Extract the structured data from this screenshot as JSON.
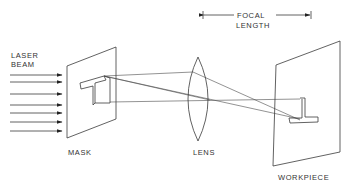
{
  "diagram": {
    "labels": {
      "laser_beam_line1": "LASER",
      "laser_beam_line2": "BEAM",
      "mask": "MASK",
      "lens": "LENS",
      "workpiece": "WORKPIECE",
      "focal_length_line1": "FOCAL",
      "focal_length_line2": "LENGTH"
    },
    "components": [
      {
        "id": "laser-beam",
        "type": "arrows",
        "count": 7
      },
      {
        "id": "mask",
        "type": "plane",
        "pattern": "T"
      },
      {
        "id": "lens",
        "type": "convex-lens"
      },
      {
        "id": "workpiece",
        "type": "plane",
        "image": "inverted T"
      }
    ],
    "dimension": {
      "label": "FOCAL LENGTH",
      "from": "lens",
      "to": "workpiece"
    },
    "colors": {
      "line": "#3a3a3a",
      "text": "#333333",
      "background": "#ffffff"
    }
  }
}
